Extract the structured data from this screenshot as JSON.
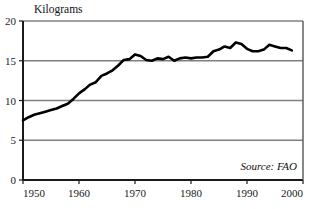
{
  "chart_data": {
    "type": "line",
    "title": "",
    "unit_label": "Kilograms",
    "xlabel": "",
    "ylabel": "Kilograms",
    "xlim": [
      1950,
      2000
    ],
    "ylim": [
      0,
      20
    ],
    "grid": true,
    "legend": false,
    "source_note": "Source: FAO",
    "x_ticks": [
      1950,
      1960,
      1970,
      1980,
      1990,
      2000
    ],
    "x_tick_labels": [
      "1950",
      "1960",
      "1970",
      "1980",
      "1990",
      "2000"
    ],
    "y_ticks": [
      0,
      5,
      10,
      15,
      20
    ],
    "y_tick_labels": [
      "0",
      "5",
      "10",
      "15",
      "20"
    ],
    "line_color": "#000000",
    "grid_color": "#808080",
    "axis_color": "#1a1a1a",
    "series": [
      {
        "name": "World Fish Catch Per Person",
        "x": [
          1950,
          1951,
          1952,
          1953,
          1954,
          1955,
          1956,
          1957,
          1958,
          1959,
          1960,
          1961,
          1962,
          1963,
          1964,
          1965,
          1966,
          1967,
          1968,
          1969,
          1970,
          1971,
          1972,
          1973,
          1974,
          1975,
          1976,
          1977,
          1978,
          1979,
          1980,
          1981,
          1982,
          1983,
          1984,
          1985,
          1986,
          1987,
          1988,
          1989,
          1990,
          1991,
          1992,
          1993,
          1994,
          1995,
          1996,
          1997,
          1998
        ],
        "values": [
          7.5,
          7.9,
          8.2,
          8.4,
          8.6,
          8.8,
          9.0,
          9.3,
          9.6,
          10.2,
          10.9,
          11.4,
          12.0,
          12.3,
          13.1,
          13.4,
          13.8,
          14.4,
          15.1,
          15.2,
          15.8,
          15.6,
          15.1,
          15.0,
          15.3,
          15.2,
          15.5,
          15.0,
          15.3,
          15.4,
          15.3,
          15.4,
          15.4,
          15.5,
          16.2,
          16.4,
          16.8,
          16.6,
          17.3,
          17.1,
          16.5,
          16.2,
          16.2,
          16.4,
          17.0,
          16.8,
          16.6,
          16.6,
          16.3
        ]
      }
    ]
  },
  "annotations": {
    "source": "Source: FAO",
    "y_axis_unit": "Kilograms"
  }
}
